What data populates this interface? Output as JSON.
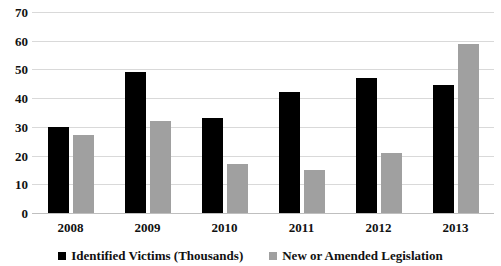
{
  "chart_data": {
    "type": "bar",
    "title": "",
    "subtitle": "",
    "xlabel": "",
    "ylabel": "",
    "categories": [
      "2008",
      "2009",
      "2010",
      "2011",
      "2012",
      "2013"
    ],
    "series": [
      {
        "name": "Identified Victims (Thousands)",
        "color": "#000000",
        "values": [
          30,
          49,
          33,
          42,
          47,
          44.5
        ]
      },
      {
        "name": "New or Amended Legislation",
        "color": "#a0a0a0",
        "values": [
          27,
          32,
          17,
          15,
          21,
          59
        ]
      }
    ],
    "ylim": [
      0,
      70
    ],
    "ytick_step": 10,
    "yticks": [
      "70",
      "60",
      "50",
      "40",
      "30",
      "20",
      "10",
      "0"
    ],
    "grid": true,
    "legend_position": "bottom"
  }
}
